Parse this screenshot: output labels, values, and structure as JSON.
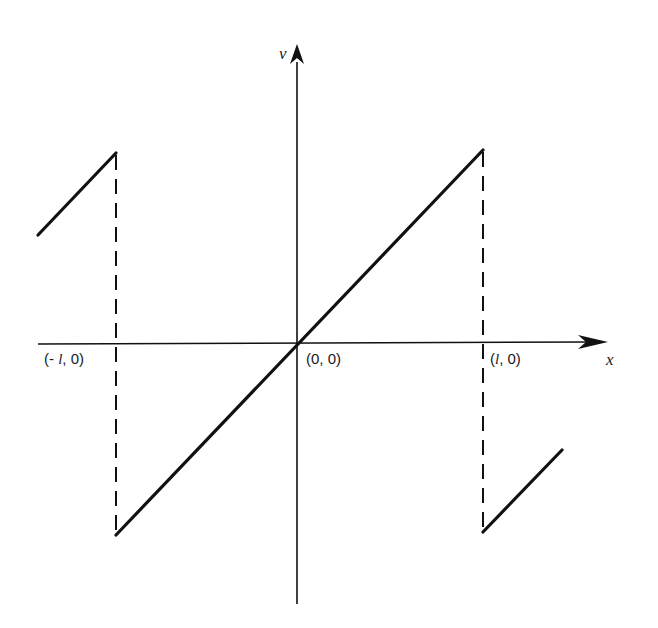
{
  "diagram": {
    "type": "sawtooth-wave-plot",
    "axes": {
      "x_label": "x",
      "y_label": "v"
    },
    "points": {
      "origin": "(0, 0)",
      "left": "(- l, 0)",
      "right": "(l, 0)"
    },
    "labels": {
      "left_prefix": "(- ",
      "left_italic": "l",
      "left_suffix": ", 0)",
      "right_prefix": "(",
      "right_italic": "l",
      "right_suffix": ", 0)",
      "origin": "(0, 0)"
    },
    "colors": {
      "line": "#111111",
      "background": "#ffffff"
    },
    "segments": [
      {
        "name": "left-partial-ramp",
        "from": [
          38,
          235
        ],
        "to": [
          116,
          153
        ],
        "style": "solid"
      },
      {
        "name": "left-discontinuity",
        "from": [
          116,
          153
        ],
        "to": [
          116,
          535
        ],
        "style": "dashed"
      },
      {
        "name": "main-ramp",
        "from": [
          116,
          535
        ],
        "to": [
          483,
          150
        ],
        "style": "solid"
      },
      {
        "name": "right-discontinuity",
        "from": [
          483,
          150
        ],
        "to": [
          483,
          532
        ],
        "style": "dashed"
      },
      {
        "name": "right-partial-ramp",
        "from": [
          483,
          532
        ],
        "to": [
          562,
          450
        ],
        "style": "solid"
      }
    ]
  }
}
